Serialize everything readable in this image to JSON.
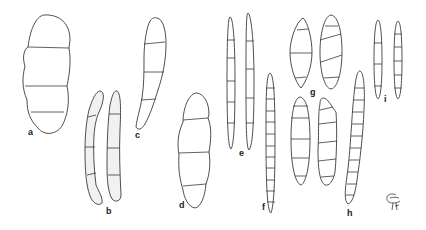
{
  "figure": {
    "type": "spore-illustration-plate",
    "labels": {
      "a": "a",
      "b": "b",
      "c": "c",
      "d": "d",
      "e": "e",
      "f": "f",
      "g": "g",
      "h": "h",
      "i": "i"
    },
    "specimens": [
      {
        "label": "a",
        "count": 1,
        "septa": 3
      },
      {
        "label": "b",
        "count": 2,
        "septa": 3,
        "shaded": true
      },
      {
        "label": "c",
        "count": 1,
        "septa": 3
      },
      {
        "label": "d",
        "count": 1,
        "septa": 3
      },
      {
        "label": "e",
        "count": 2,
        "septa": [
          5,
          4
        ]
      },
      {
        "label": "f",
        "count": 1,
        "septa": 11
      },
      {
        "label": "g",
        "count": 4,
        "septa": [
          3,
          4,
          5,
          6
        ]
      },
      {
        "label": "h",
        "count": 1,
        "septa": 10
      },
      {
        "label": "i",
        "count": 2,
        "septa": [
          3,
          5
        ]
      }
    ],
    "logo": "monogram-mark",
    "colors": {
      "line": "#3a3a3a",
      "background": "#ffffff",
      "shade": "#f1f1f1"
    }
  }
}
